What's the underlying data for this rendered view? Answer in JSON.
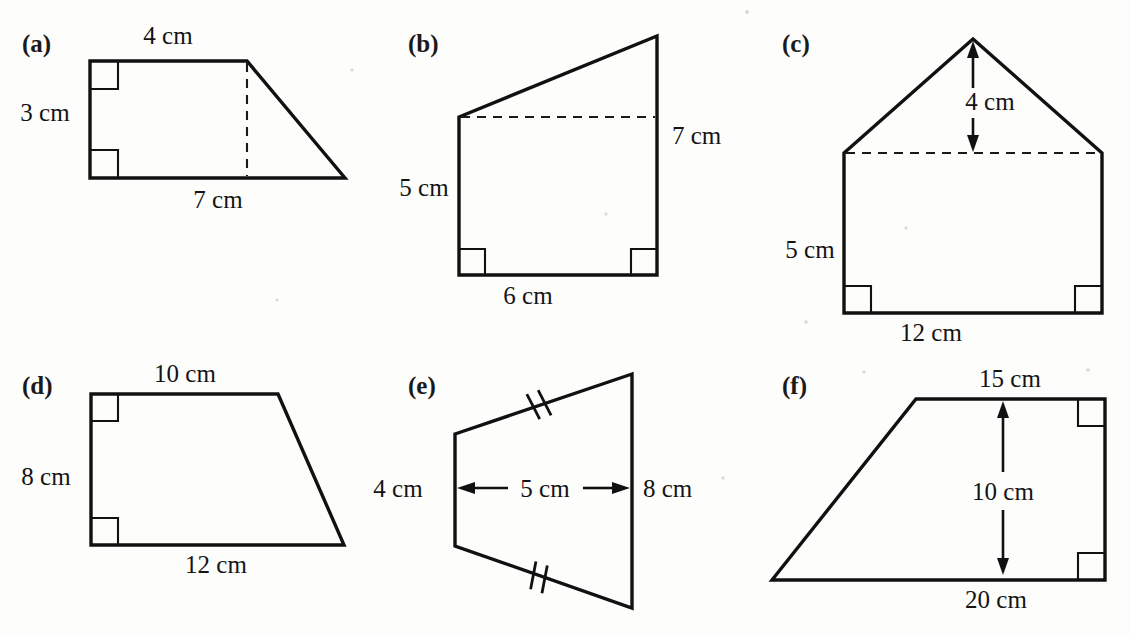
{
  "page": {
    "background_color": "#fdfdfc",
    "ink_color": "#111111",
    "width": 1130,
    "height": 636
  },
  "figures": [
    {
      "id": "a",
      "part_label": "(a)",
      "shape": "right trapezium",
      "labels": {
        "top": "4 cm",
        "left": "3 cm",
        "bottom": "7 cm"
      },
      "right_angle_count": 2,
      "has_dashed_height": true
    },
    {
      "id": "b",
      "part_label": "(b)",
      "shape": "right trapezium",
      "labels": {
        "left": "5 cm",
        "right": "7 cm",
        "bottom": "6 cm"
      },
      "right_angle_count": 2,
      "has_dashed_height": true
    },
    {
      "id": "c",
      "part_label": "(c)",
      "shape": "pentagon (house)",
      "labels": {
        "roof_height": "4 cm",
        "left": "5 cm",
        "bottom": "12 cm"
      },
      "right_angle_count": 2,
      "has_dashed_height": true
    },
    {
      "id": "d",
      "part_label": "(d)",
      "shape": "right trapezium",
      "labels": {
        "top": "10 cm",
        "left": "8 cm",
        "bottom": "12 cm"
      },
      "right_angle_count": 2,
      "has_dashed_height": false
    },
    {
      "id": "e",
      "part_label": "(e)",
      "shape": "trapezium with equal slanted sides",
      "labels": {
        "left": "4 cm",
        "middle": "5 cm",
        "right": "8 cm"
      },
      "right_angle_count": 0,
      "tick_marks": 2,
      "has_dashed_height": false
    },
    {
      "id": "f",
      "part_label": "(f)",
      "shape": "right trapezium",
      "labels": {
        "top": "15 cm",
        "height": "10 cm",
        "bottom": "20 cm"
      },
      "right_angle_count": 2,
      "has_dashed_height": false
    }
  ],
  "geometry": {
    "a": {
      "outline": "M 90 61 L 247 61 L 345 178 L 90 178 Z",
      "dashed": "M 247 63 L 247 176",
      "right_angles": [
        "M 90 89 L 118 89 L 118 61",
        "M 90 150 L 118 150 L 118 178"
      ],
      "label_positions": {
        "part": [
          22,
          52
        ],
        "top": [
          168,
          44
        ],
        "left": [
          45,
          121
        ],
        "bottom": [
          218,
          208
        ]
      }
    },
    "b": {
      "outline": "M 459 117 L 657 36 L 657 275 L 459 275 Z",
      "dashed": "M 461 117 L 655 117",
      "right_angles": [
        "M 459 249 L 485 249 L 485 275",
        "M 657 249 L 631 249 L 631 275"
      ],
      "label_positions": {
        "part": [
          408,
          52
        ],
        "left": [
          424,
          196
        ],
        "right": [
          672,
          144
        ],
        "bottom": [
          528,
          304
        ]
      }
    },
    "c": {
      "outline": "M 973 39 L 1102 153 L 1102 313 L 844 313 L 844 153 Z",
      "dashed": "M 846 153 L 1100 153",
      "right_angles": [
        "M 844 286 L 871 286 L 871 313",
        "M 1102 286 L 1075 286 L 1075 313"
      ],
      "arrow": {
        "x": 973,
        "top_y": 47,
        "bottom_y": 150,
        "gap_top": 88,
        "gap_bottom": 118
      },
      "label_positions": {
        "part": [
          782,
          52
        ],
        "roof_height": [
          990,
          110
        ],
        "left": [
          810,
          258
        ],
        "bottom": [
          931,
          341
        ]
      }
    },
    "d": {
      "outline": "M 91 394 L 278 394 L 344 545 L 91 545 Z",
      "right_angles": [
        "M 91 421 L 118 421 L 118 394",
        "M 91 518 L 118 518 L 118 545"
      ],
      "label_positions": {
        "part": [
          22,
          394
        ],
        "top": [
          185,
          382
        ],
        "left": [
          46,
          485
        ],
        "bottom": [
          216,
          573
        ]
      }
    },
    "e": {
      "outline": "M 455 434 L 632 374 L 632 608 L 455 546 Z",
      "ticks": [
        {
          "cx": 538,
          "cy": 405,
          "angle": -19
        },
        {
          "cx": 538,
          "cy": 577,
          "angle": 19
        }
      ],
      "arrow": {
        "left_x": 459,
        "right_x": 628,
        "y": 488,
        "gap_start": 505,
        "gap_end": 585
      },
      "label_positions": {
        "part": [
          408,
          394
        ],
        "left": [
          398,
          497
        ],
        "middle": [
          545,
          497
        ],
        "right": [
          643,
          497
        ]
      }
    },
    "f": {
      "outline": "M 772 580 L 916 399 L 1105 399 L 1105 580 Z",
      "right_angles": [
        "M 1105 426 L 1078 426 L 1078 399",
        "M 1105 553 L 1078 553 L 1078 580"
      ],
      "arrow": {
        "x": 1003,
        "top_y": 407,
        "bottom_y": 573,
        "gap_top": 470,
        "gap_bottom": 508
      },
      "label_positions": {
        "part": [
          782,
          394
        ],
        "top": [
          1010,
          387
        ],
        "height": [
          1003,
          500
        ],
        "bottom": [
          996,
          608
        ]
      }
    }
  }
}
